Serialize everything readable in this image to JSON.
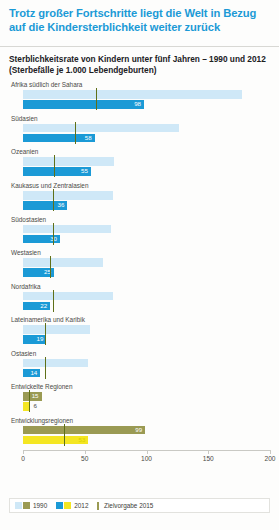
{
  "header": {
    "title": "Trotz großer Fortschritte liegt die Welt in Bezug auf die Kindersterblichkeit weiter zurück",
    "subtitle": "Sterblichkeitsrate von Kindern unter fünf Jahren – 1990 und 2012 (Sterbefälle je 1.000 Lebendgeburten)"
  },
  "legend": {
    "item_1990": "1990",
    "item_2012": "2012",
    "item_target": "Zielvorgabe 2015"
  },
  "colors": {
    "title": "#1b9ad6",
    "bar_1990_blue": "#cfe8f7",
    "bar_2012_blue": "#1b9ad6",
    "bar_1990_olive": "#9a9a53",
    "bar_2012_yellow": "#f4e622",
    "target_line": "#5f7018"
  },
  "chart_data": {
    "type": "bar",
    "title": "Sterblichkeitsrate von Kindern unter fünf Jahren – 1990 und 2012",
    "subtitle": "(Sterbefälle je 1.000 Lebendgeburten)",
    "xlabel": "",
    "ylabel": "",
    "xlim": [
      0,
      200
    ],
    "xticks": [
      0,
      50,
      100,
      150,
      200
    ],
    "xticklabels": [
      "0",
      "50",
      "100",
      "150",
      "200"
    ],
    "grid": false,
    "legend_position": "bottom",
    "categories": [
      "Afrika südlich der Sahara",
      "Südasien",
      "Ozeanien",
      "Kaukasus und Zentralasien",
      "Südostasien",
      "Westasien",
      "Nordafrika",
      "Lateinamerika und Karibik",
      "Ostasien",
      "Entwickelte Regionen",
      "Entwicklungsregionen"
    ],
    "series": [
      {
        "name": "1990",
        "values": [
          177,
          126,
          74,
          73,
          71,
          65,
          73,
          54,
          53,
          15,
          99
        ]
      },
      {
        "name": "2012",
        "values": [
          98,
          58,
          55,
          36,
          30,
          25,
          22,
          19,
          14,
          6,
          53
        ]
      },
      {
        "name": "Zielvorgabe 2015",
        "values": [
          59,
          42,
          25,
          24,
          24,
          22,
          24,
          18,
          18,
          5,
          33
        ]
      }
    ],
    "value_labels_2012": [
      "98",
      "58",
      "55",
      "36",
      "30",
      "25",
      "22",
      "19",
      "14",
      "6",
      "53"
    ],
    "value_labels_1990": [
      "",
      "",
      "",
      "",
      "",
      "",
      "",
      "",
      "",
      "15",
      "99"
    ]
  }
}
